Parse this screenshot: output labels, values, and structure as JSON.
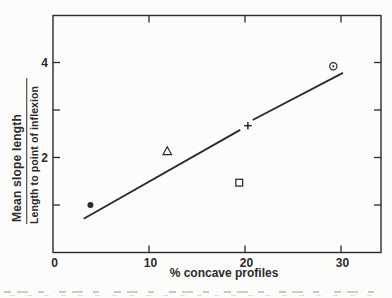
{
  "figure": {
    "background": "#fcfcfa",
    "ink_color": "#2b2b2b"
  },
  "chart_data": {
    "type": "scatter",
    "title": "",
    "xlabel": "% concave profiles",
    "ylabel": "Mean slope length / Length to point of inflexion",
    "ylabel_numerator": "Mean slope length",
    "ylabel_denominator": "Length to point of inflexion",
    "xlim": [
      0,
      34
    ],
    "ylim": [
      0,
      5
    ],
    "grid": false,
    "legend": null,
    "x_ticks": [
      {
        "value": 0,
        "label": "0"
      },
      {
        "value": 10,
        "label": "10"
      },
      {
        "value": 20,
        "label": "20"
      },
      {
        "value": 30,
        "label": "30"
      }
    ],
    "y_ticks": [
      {
        "value": 1,
        "label": ""
      },
      {
        "value": 2,
        "label": "2"
      },
      {
        "value": 3,
        "label": ""
      },
      {
        "value": 4,
        "label": "4"
      }
    ],
    "points": [
      {
        "marker": "filled-circle",
        "x": 3.9,
        "y": 1.0
      },
      {
        "marker": "open-triangle",
        "x": 11.9,
        "y": 2.13
      },
      {
        "marker": "open-square",
        "x": 19.4,
        "y": 1.47
      },
      {
        "marker": "plus",
        "x": 20.3,
        "y": 2.67
      },
      {
        "marker": "circled-dot",
        "x": 29.2,
        "y": 3.92
      }
    ],
    "trend_line": {
      "style": "solid",
      "segments": [
        {
          "x1": 3.2,
          "y1": 0.71,
          "x2": 19.5,
          "y2": 2.58
        },
        {
          "x1": 20.8,
          "y1": 2.79,
          "x2": 30.2,
          "y2": 3.78
        }
      ]
    }
  }
}
